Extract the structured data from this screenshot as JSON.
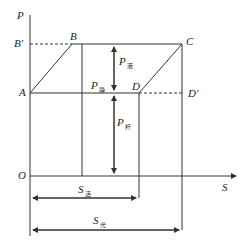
{
  "diagram": {
    "title": "",
    "axes": {
      "y_label": "P",
      "x_label": "S",
      "origin": "O"
    },
    "points": {
      "A": "A",
      "B": "B",
      "B_prime": "B'",
      "C": "C",
      "D": "D",
      "D_prime": "D'"
    },
    "loads": [
      {
        "symbol": "P",
        "sub": "液"
      },
      {
        "symbol": "P",
        "sub": "静"
      },
      {
        "symbol": "P",
        "sub": "杆"
      }
    ],
    "strokes": [
      {
        "symbol": "S",
        "sub": "活"
      },
      {
        "symbol": "S",
        "sub": "光"
      }
    ],
    "colors": {
      "line": "#333333",
      "background": "#ffffff"
    }
  }
}
